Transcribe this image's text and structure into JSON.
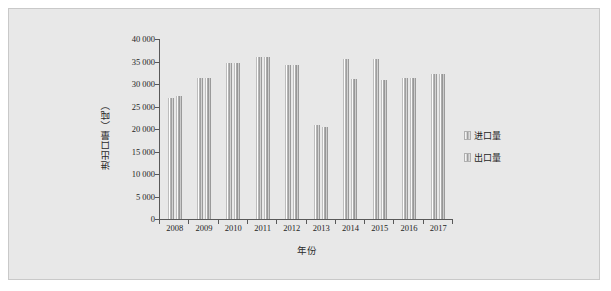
{
  "chart_data": {
    "type": "bar",
    "title": "",
    "xlabel": "年份",
    "ylabel": "进出口量（吨）",
    "categories": [
      "2008",
      "2009",
      "2010",
      "2011",
      "2012",
      "2013",
      "2014",
      "2015",
      "2016",
      "2017"
    ],
    "series": [
      {
        "name": "进口量",
        "values": [
          27000,
          31300,
          34600,
          36100,
          34300,
          21000,
          35600,
          35600,
          31300,
          32300
        ]
      },
      {
        "name": "出口量",
        "values": [
          27400,
          31300,
          34700,
          36100,
          34300,
          20500,
          31100,
          30900,
          31300,
          32300
        ]
      }
    ],
    "ylim": [
      0,
      40000
    ],
    "ytick_labels": [
      "0",
      "5 000",
      "10 000",
      "15 000",
      "20 000",
      "25 000",
      "30 000",
      "35 000",
      "40 000"
    ],
    "ytick_values": [
      0,
      5000,
      10000,
      15000,
      20000,
      25000,
      30000,
      35000,
      40000
    ],
    "grid": false,
    "legend_position": "right"
  },
  "legend": {
    "items": [
      {
        "label": "进口量",
        "marker": "bar-swatch-icon"
      },
      {
        "label": "出口量",
        "marker": "bar-swatch-icon"
      }
    ]
  },
  "colors": {
    "figure_background": "#e8e8e8",
    "frame_border": "#c9c9c9",
    "axis": "#595959",
    "text": "#1f1f1f"
  }
}
